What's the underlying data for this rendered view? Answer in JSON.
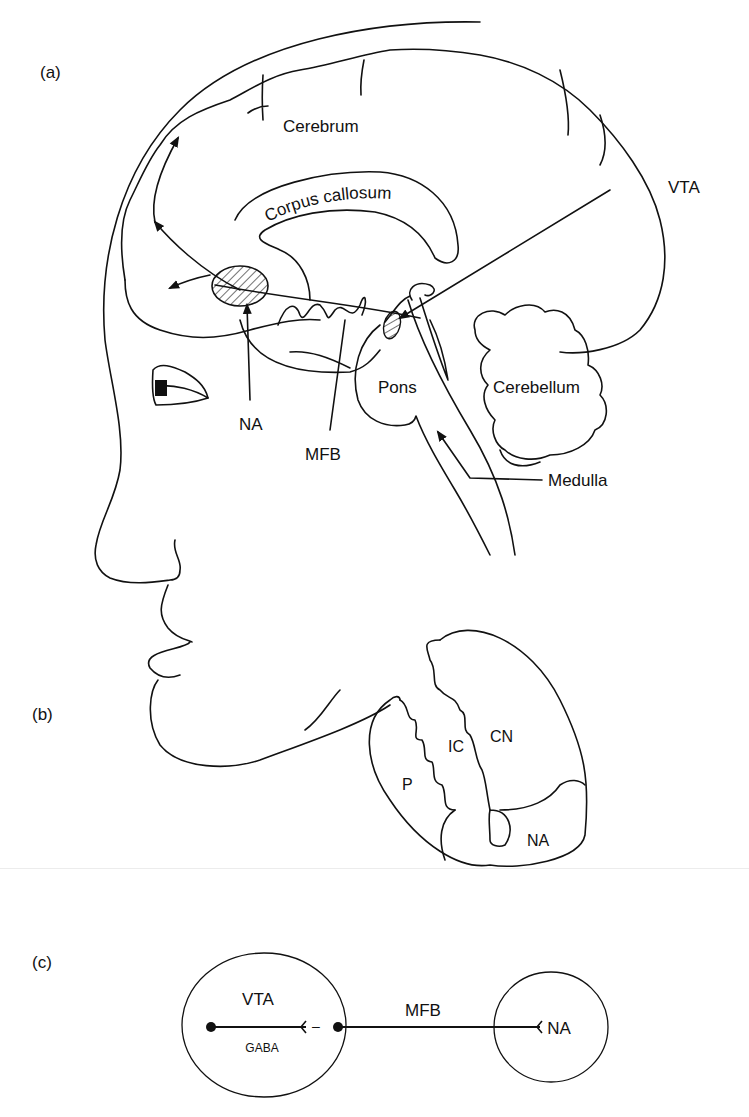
{
  "panels": {
    "a": {
      "label": "(a)",
      "structures": {
        "cerebrum": "Cerebrum",
        "corpus_callosum": "Corpus callosum",
        "vta": "VTA",
        "na": "NA",
        "mfb": "MFB",
        "pons": "Pons",
        "cerebellum": "Cerebellum",
        "medulla": "Medulla"
      }
    },
    "b": {
      "label": "(b)",
      "regions": {
        "cn": "CN",
        "ic": "IC",
        "p": "P",
        "na": "NA"
      }
    },
    "c": {
      "label": "(c)",
      "nodes": {
        "vta": "VTA",
        "na": "NA"
      },
      "pathway": "MFB",
      "interneuron": "GABA",
      "inhibition_sign": "–"
    }
  }
}
